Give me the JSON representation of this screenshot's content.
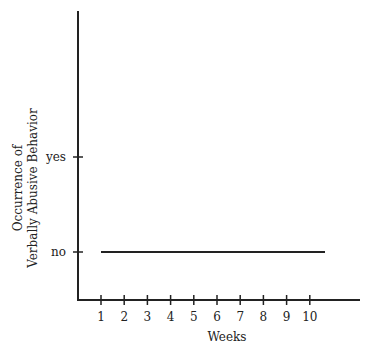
{
  "chart_data": {
    "type": "line",
    "title": "",
    "xlabel": "Weeks",
    "ylabel": "Occurrence of\nVerbally Abusive Behavior",
    "ylabel_lines": [
      "Occurrence of",
      "Verbally Abusive Behavior"
    ],
    "x": [
      1,
      2,
      3,
      4,
      5,
      6,
      7,
      8,
      9,
      10
    ],
    "x_tick_labels": [
      "1",
      "2",
      "3",
      "4",
      "5",
      "6",
      "7",
      "8",
      "9",
      "10"
    ],
    "y_categories": [
      "no",
      "yes"
    ],
    "series": [
      {
        "name": "Verbally Abusive Behavior",
        "values": [
          "no",
          "no",
          "no",
          "no",
          "no",
          "no",
          "no",
          "no",
          "no",
          "no"
        ],
        "numeric_values": [
          0,
          0,
          0,
          0,
          0,
          0,
          0,
          0,
          0,
          0
        ]
      }
    ],
    "grid": false,
    "legend": "none",
    "line_color": "#222222"
  }
}
